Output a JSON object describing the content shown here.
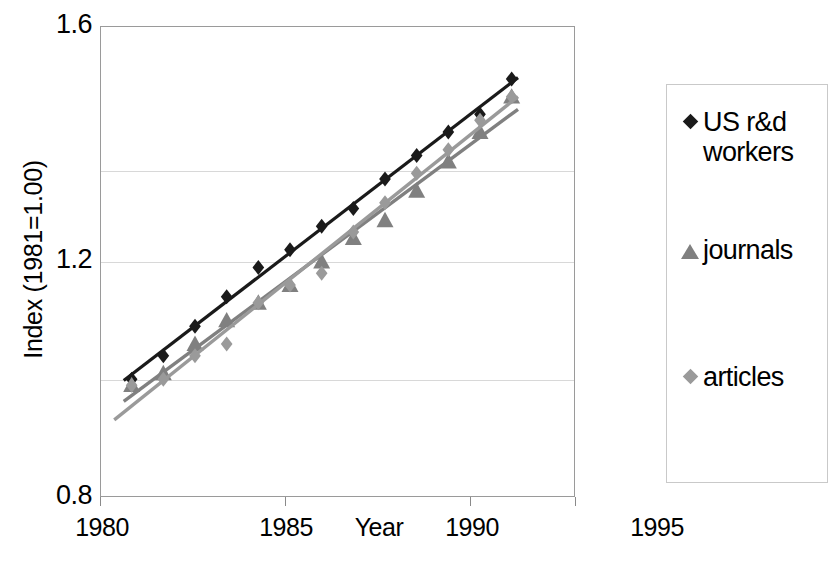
{
  "chart_data": {
    "type": "scatter",
    "title": "",
    "xlabel": "Year",
    "ylabel": "Index (1981=1.00)",
    "xlim": [
      1980,
      1995
    ],
    "ylim": [
      0.8,
      1.6
    ],
    "xticks": [
      "1980",
      "1985",
      "1990",
      "1995"
    ],
    "yticks": [
      "0.8",
      "1.2",
      "1.6"
    ],
    "gridlines_y": [
      1.0,
      1.2,
      1.4
    ],
    "grid": true,
    "legend_position": "right",
    "x": [
      1981,
      1982,
      1983,
      1984,
      1985,
      1986,
      1987,
      1988,
      1989,
      1990,
      1991,
      1992,
      1993
    ],
    "series": [
      {
        "name": "US r&d workers",
        "marker": "diamond",
        "color": "#1a1a1a",
        "trendline": true,
        "values": [
          1.0,
          1.04,
          1.09,
          1.14,
          1.19,
          1.22,
          1.26,
          1.29,
          1.34,
          1.38,
          1.42,
          1.45,
          1.51
        ]
      },
      {
        "name": "journals",
        "marker": "triangle",
        "color": "#808080",
        "trendline": true,
        "values": [
          0.99,
          1.01,
          1.06,
          1.1,
          1.13,
          1.16,
          1.2,
          1.24,
          1.27,
          1.32,
          1.37,
          1.42,
          1.48
        ]
      },
      {
        "name": "articles",
        "marker": "diamond",
        "color": "#9a9a9a",
        "trendline": true,
        "values": [
          0.99,
          1.0,
          1.04,
          1.06,
          1.13,
          1.16,
          1.18,
          1.25,
          1.3,
          1.35,
          1.39,
          1.44,
          1.48
        ]
      }
    ]
  },
  "axes": {
    "y_title": "Index (1981=1.00)",
    "x_title": "Year",
    "y_ticks": [
      "1.6",
      "1.2",
      "0.8"
    ],
    "x_ticks": [
      "1980",
      "1985",
      "1990",
      "1995"
    ]
  },
  "legend": {
    "entries": [
      {
        "label": "US r&d\nworkers",
        "marker": "diamond-black-icon",
        "color": "#1a1a1a"
      },
      {
        "label": "journals",
        "marker": "triangle-gray-icon",
        "color": "#808080"
      },
      {
        "label": "articles",
        "marker": "diamond-gray-icon",
        "color": "#9a9a9a"
      }
    ]
  },
  "title_fragment": "y"
}
